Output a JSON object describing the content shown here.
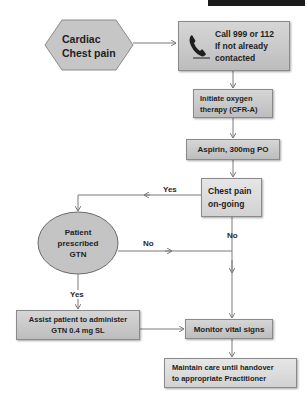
{
  "title_bar": {
    "present": true
  },
  "nodes": {
    "start": {
      "line1": "Cardiac",
      "line2": "Chest pain",
      "shape": "hexagon",
      "icon": ""
    },
    "call": {
      "line1": "Call 999 or 112",
      "line2": "If not already",
      "line3": "contacted",
      "icon": "phone-icon"
    },
    "oxygen": {
      "line1": "Initiate oxygen",
      "line2": "therapy (CFR-A)"
    },
    "aspirin": {
      "text": "Aspirin, 300mg PO"
    },
    "chest_pain_ongoing": {
      "line1": "Chest pain",
      "line2": "on-going"
    },
    "gtn_prescribed": {
      "line1": "Patient",
      "line2": "prescribed",
      "line3": "GTN",
      "shape": "ellipse"
    },
    "assist_gtn": {
      "line1": "Assist patient to administer",
      "line2": "GTN 0.4 mg SL"
    },
    "monitor": {
      "text": "Monitor vital signs"
    },
    "maintain": {
      "line1": "Maintain care until handover",
      "line2": "to appropriate Practitioner"
    }
  },
  "edges": {
    "chest_pain_yes": "Yes",
    "chest_pain_no": "No",
    "gtn_no": "No",
    "gtn_yes": "Yes"
  },
  "colors": {
    "box_fill": "#c8c8c8",
    "box_border": "#8a8a8a",
    "line": "#7a7a7a",
    "text": "#1e1e1e",
    "top_bar": "#1b1b1b"
  }
}
